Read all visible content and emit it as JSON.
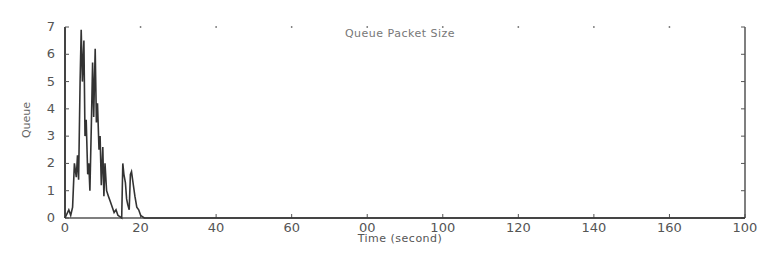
{
  "chart_data": {
    "type": "line",
    "title": "Queue Packet Size",
    "xlabel": "Time (second)",
    "ylabel": "Queue",
    "xlim": [
      0,
      180
    ],
    "ylim": [
      0,
      7
    ],
    "grid": false,
    "legend": null,
    "x_tick_labels": [
      "0",
      "20",
      "40",
      "60",
      "00",
      "100",
      "120",
      "140",
      "160",
      "100"
    ],
    "y_tick_labels": [
      "0",
      "1",
      "2",
      "3",
      "4",
      "5",
      "6",
      "7"
    ],
    "series": [
      {
        "name": "Queue Packet Size",
        "x": [
          0,
          1,
          1.5,
          2,
          2.5,
          3,
          3.3,
          3.6,
          4,
          4.3,
          4.6,
          5,
          5.3,
          5.6,
          6,
          6.3,
          6.6,
          7,
          7.3,
          7.6,
          8,
          8.3,
          8.6,
          9,
          9.3,
          9.6,
          10,
          10.3,
          10.6,
          11,
          11.5,
          12,
          12.5,
          13,
          13.5,
          14,
          14.5,
          15,
          15.3,
          15.6,
          16,
          16.3,
          16.6,
          17,
          17.3,
          17.6,
          18,
          18.5,
          19,
          19.5,
          20,
          20.5,
          21,
          22,
          30,
          60,
          100,
          140,
          180
        ],
        "y": [
          0,
          0.3,
          0.1,
          0.4,
          2.0,
          1.5,
          2.3,
          1.4,
          5.0,
          6.9,
          5.0,
          6.5,
          3.0,
          3.6,
          1.6,
          2.0,
          1.0,
          3.5,
          5.7,
          3.7,
          6.2,
          3.5,
          4.2,
          2.5,
          3.0,
          1.2,
          2.6,
          0.8,
          2.0,
          1.0,
          0.8,
          0.6,
          0.4,
          0.2,
          0.3,
          0.1,
          0.05,
          0.0,
          2.0,
          1.6,
          1.3,
          0.7,
          0.5,
          0.3,
          1.6,
          1.7,
          1.3,
          0.8,
          0.4,
          0.3,
          0.1,
          0.05,
          0.0,
          0,
          0,
          0,
          0,
          0,
          0
        ]
      }
    ]
  }
}
